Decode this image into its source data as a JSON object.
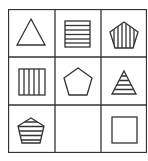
{
  "puzzle": {
    "type": "3x3 shape matrix",
    "colors": {
      "line": "#333333",
      "background": "#ffffff"
    },
    "cells": [
      {
        "row": 0,
        "col": 0,
        "shape": "triangle",
        "fill": "none"
      },
      {
        "row": 0,
        "col": 1,
        "shape": "square",
        "fill": "horizontal-stripes"
      },
      {
        "row": 0,
        "col": 2,
        "shape": "pentagon",
        "fill": "vertical-stripes"
      },
      {
        "row": 1,
        "col": 0,
        "shape": "square",
        "fill": "vertical-stripes"
      },
      {
        "row": 1,
        "col": 1,
        "shape": "pentagon",
        "fill": "none"
      },
      {
        "row": 1,
        "col": 2,
        "shape": "triangle",
        "fill": "horizontal-stripes"
      },
      {
        "row": 2,
        "col": 0,
        "shape": "pentagon",
        "fill": "horizontal-stripes"
      },
      {
        "row": 2,
        "col": 1,
        "shape": "empty",
        "fill": "none"
      },
      {
        "row": 2,
        "col": 2,
        "shape": "square",
        "fill": "none"
      }
    ]
  }
}
